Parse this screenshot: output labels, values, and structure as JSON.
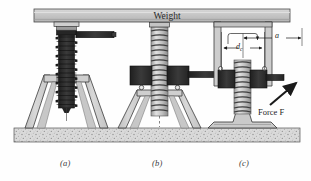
{
  "figure": {
    "kind": "engineering-diagram",
    "weight_label": "Weight",
    "force_label": "Force F",
    "dimension_dc": "d",
    "dimension_dc_sub": "c",
    "dimension_a": "a",
    "captions": [
      {
        "key": "a",
        "text": "(a)"
      },
      {
        "key": "b",
        "text": "(b)"
      },
      {
        "key": "c",
        "text": "(c)"
      }
    ]
  },
  "colors": {
    "dark_metal": "#2b2b2b",
    "mid_metal": "#6f6f6f",
    "light_metal": "#c9c9c9",
    "beam_face": "#c2c2c2",
    "beam_top": "#d6d6d6",
    "beam_edge": "#9a9a9a",
    "ground_fill": "#d9d9d9",
    "outline": "#1a1a1a",
    "text": "#2a2a2a"
  }
}
